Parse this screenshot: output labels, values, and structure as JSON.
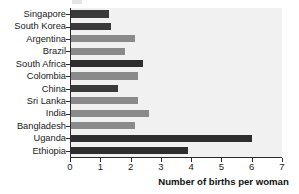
{
  "chart_data": {
    "type": "bar",
    "orientation": "horizontal",
    "title": "",
    "xlabel": "Number of births per woman",
    "ylabel": "",
    "xlim": [
      0,
      7
    ],
    "xticks": [
      0,
      1,
      2,
      3,
      4,
      5,
      6,
      7
    ],
    "xtick_labels": [
      "0",
      "1",
      "2",
      "3",
      "4",
      "5",
      "6",
      "7"
    ],
    "grid": false,
    "legend": "none",
    "categories": [
      "Singapore",
      "South Korea",
      "Argentina",
      "Brazil",
      "South Africa",
      "Colombia",
      "China",
      "Sri Lanka",
      "India",
      "Bangladesh",
      "Uganda",
      "Ethiopia"
    ],
    "values": [
      1.3,
      1.35,
      2.15,
      1.8,
      2.4,
      2.25,
      1.6,
      2.25,
      2.6,
      2.15,
      6.0,
      3.9
    ],
    "bar_colors": [
      "#3a3a3a",
      "#3a3a3a",
      "#8a8a8a",
      "#8a8a8a",
      "#2e2e2e",
      "#8a8a8a",
      "#3a3a3a",
      "#8a8a8a",
      "#8a8a8a",
      "#8a8a8a",
      "#2e2e2e",
      "#2e2e2e"
    ]
  },
  "style": {
    "plot_background": "#f1f1f1",
    "axis_color": "#2b2b2b",
    "text_color": "#1a1a1a",
    "dark_bar": "#3a3a3a",
    "light_bar": "#8a8a8a"
  }
}
